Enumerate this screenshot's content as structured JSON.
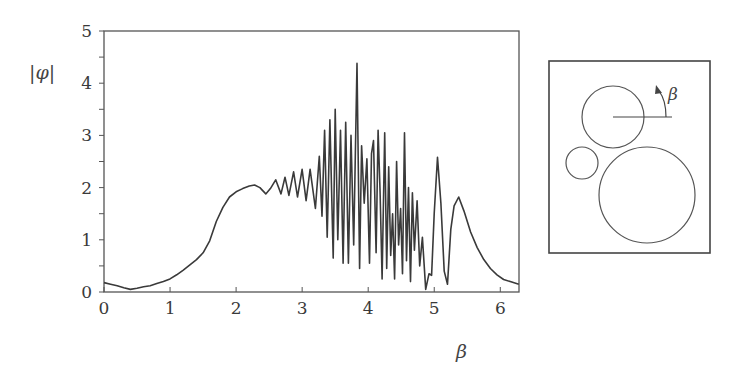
{
  "chart_data": {
    "type": "line",
    "title": "",
    "xlabel": "β",
    "ylabel": "|φ|",
    "xlim": [
      0,
      6.2832
    ],
    "ylim": [
      0,
      5
    ],
    "grid": false,
    "legend": null,
    "x_ticks": [
      "0",
      "1",
      "2",
      "3",
      "4",
      "5",
      "6"
    ],
    "y_ticks": [
      "0",
      "1",
      "2",
      "3",
      "4",
      "5"
    ],
    "series": [
      {
        "name": "|φ|(β)",
        "x": [
          0.0,
          0.1,
          0.2,
          0.3,
          0.4,
          0.5,
          0.6,
          0.7,
          0.8,
          0.9,
          1.0,
          1.1,
          1.2,
          1.3,
          1.4,
          1.5,
          1.6,
          1.7,
          1.8,
          1.9,
          2.0,
          2.1,
          2.2,
          2.28,
          2.36,
          2.45,
          2.52,
          2.6,
          2.68,
          2.74,
          2.8,
          2.87,
          2.93,
          3.0,
          3.06,
          3.12,
          3.2,
          3.26,
          3.3,
          3.34,
          3.38,
          3.42,
          3.47,
          3.5,
          3.54,
          3.58,
          3.62,
          3.66,
          3.7,
          3.74,
          3.78,
          3.83,
          3.87,
          3.9,
          3.94,
          3.98,
          4.02,
          4.05,
          4.08,
          4.12,
          4.15,
          4.18,
          4.21,
          4.25,
          4.28,
          4.31,
          4.34,
          4.37,
          4.4,
          4.43,
          4.46,
          4.49,
          4.52,
          4.55,
          4.58,
          4.61,
          4.64,
          4.67,
          4.7,
          4.74,
          4.78,
          4.82,
          4.87,
          4.92,
          4.96,
          5.0,
          5.05,
          5.1,
          5.15,
          5.2,
          5.25,
          5.3,
          5.37,
          5.45,
          5.55,
          5.65,
          5.75,
          5.85,
          5.95,
          6.05,
          6.15,
          6.28
        ],
        "y": [
          0.18,
          0.15,
          0.12,
          0.08,
          0.05,
          0.07,
          0.1,
          0.12,
          0.16,
          0.2,
          0.25,
          0.33,
          0.42,
          0.52,
          0.62,
          0.75,
          0.98,
          1.35,
          1.62,
          1.82,
          1.92,
          1.98,
          2.03,
          2.05,
          2.0,
          1.88,
          1.98,
          2.15,
          1.88,
          2.2,
          1.85,
          2.3,
          1.82,
          2.35,
          1.75,
          2.35,
          1.6,
          2.6,
          1.45,
          3.1,
          1.05,
          3.3,
          0.65,
          3.5,
          1.0,
          3.1,
          0.55,
          3.25,
          0.55,
          3.0,
          0.9,
          4.38,
          0.45,
          2.8,
          1.7,
          2.55,
          0.55,
          2.65,
          2.9,
          0.75,
          3.1,
          1.9,
          0.25,
          3.05,
          0.45,
          2.4,
          0.7,
          1.5,
          0.25,
          2.5,
          0.9,
          1.6,
          0.35,
          3.05,
          0.6,
          2.0,
          0.2,
          1.9,
          0.8,
          1.75,
          0.5,
          1.05,
          0.05,
          0.35,
          0.32,
          1.5,
          2.58,
          1.7,
          0.4,
          0.15,
          1.2,
          1.65,
          1.82,
          1.55,
          1.15,
          0.85,
          0.62,
          0.45,
          0.33,
          0.24,
          0.2,
          0.15
        ]
      }
    ]
  },
  "inset": {
    "angle_label": "β"
  }
}
